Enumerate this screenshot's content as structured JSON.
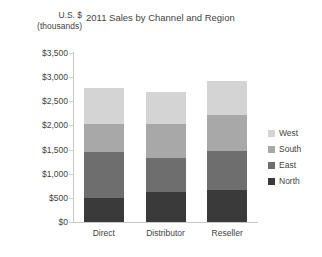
{
  "chart_data": {
    "type": "bar",
    "subtype": "stacked-column",
    "title": "2011 Sales by Channel and Region",
    "xlabel": "",
    "ylabel": "U.S. $ (thousands)",
    "ylabel_line1": "U.S. $",
    "ylabel_line2": "(thousands)",
    "categories": [
      "Direct",
      "Distributor",
      "Reseller"
    ],
    "series": [
      {
        "name": "North",
        "values": [
          500,
          620,
          670
        ],
        "color": "#3a3a3a"
      },
      {
        "name": "East",
        "values": [
          950,
          700,
          810
        ],
        "color": "#6e6e6e"
      },
      {
        "name": "South",
        "values": [
          575,
          710,
          740
        ],
        "color": "#a8a8a8"
      },
      {
        "name": "West",
        "values": [
          750,
          660,
          710
        ],
        "color": "#d4d4d4"
      }
    ],
    "stack_order_bottom_to_top": [
      "North",
      "East",
      "South",
      "West"
    ],
    "totals": [
      2775,
      2690,
      2930
    ],
    "ylim": [
      0,
      3500
    ],
    "ytick_values": [
      0,
      500,
      1000,
      1500,
      2000,
      2500,
      3000,
      3500
    ],
    "ytick_labels": [
      "$0",
      "$500",
      "$1,000",
      "$1,500",
      "$2,000",
      "$2,500",
      "$3,000",
      "$3,500"
    ],
    "grid": false,
    "legend_position": "right",
    "legend_order_top_to_bottom": [
      "West",
      "South",
      "East",
      "North"
    ],
    "background_color": "#ffffff",
    "axis_color": "#c9c9c9",
    "text_color": "#3f3f3f"
  }
}
